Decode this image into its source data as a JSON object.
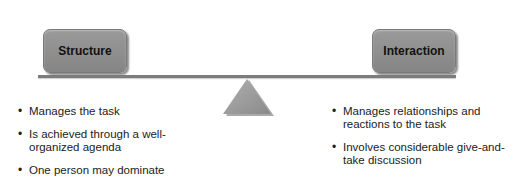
{
  "diagram": {
    "left": {
      "label": "Structure",
      "points": [
        "Manages the task",
        "Is achieved through a well-organized agenda",
        "One person may dominate"
      ]
    },
    "right": {
      "label": "Interaction",
      "points": [
        "Manages relationships and reactions to the task",
        "Involves considerable give-and-take discussion"
      ]
    },
    "colors": {
      "box_fill": "#8f8f8f",
      "beam": "#7c7c7c",
      "fulcrum": "#9a9a9a",
      "text": "#222222"
    }
  }
}
